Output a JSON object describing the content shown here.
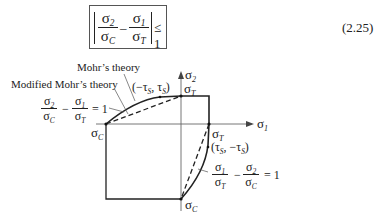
{
  "equation": {
    "number": "(2.25)",
    "sigma": "σ",
    "sub_2": "2",
    "sub_1": "1",
    "sub_C": "C",
    "sub_T": "T",
    "minus": "–",
    "leq": "≤ 1"
  },
  "diagram": {
    "axis_x_label_sym": "σ",
    "axis_x_label_sub": "1",
    "axis_y_label_sym": "σ",
    "axis_y_label_sub": "2",
    "label_top_sigmaT": {
      "sym": "σ",
      "sub": "T"
    },
    "label_right_sigmaT": {
      "sym": "σ",
      "sub": "T"
    },
    "label_left_sigmaC": {
      "sym": "σ",
      "sub": "C"
    },
    "label_bottom_sigmaC": {
      "sym": "σ",
      "sub": "C"
    },
    "mohr_theory": "Mohr’s theory",
    "modified_mohr_theory": "Modified Mohr’s theory",
    "point_upper": {
      "open": "(−τ",
      "sub1": "S",
      "mid": ", τ",
      "sub2": "S",
      "close": ")"
    },
    "point_lower": {
      "open": "(τ",
      "sub1": "S",
      "mid": ", −τ",
      "sub2": "S",
      "close": ")"
    },
    "eq_upper": {
      "num1": "σ",
      "num1_sub": "2",
      "den1": "σ",
      "den1_sub": "C",
      "op": "−",
      "num2": "σ",
      "num2_sub": "1",
      "den2": "σ",
      "den2_sub": "T",
      "rhs": "= 1"
    },
    "eq_lower": {
      "num1": "σ",
      "num1_sub": "1",
      "den1": "σ",
      "den1_sub": "T",
      "op": "−",
      "num2": "σ",
      "num2_sub": "2",
      "den2": "σ",
      "den2_sub": "C",
      "rhs": "= 1"
    }
  }
}
